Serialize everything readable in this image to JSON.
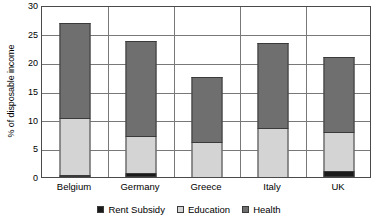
{
  "chart_data": {
    "type": "bar",
    "subtype": "stacked",
    "title": "",
    "xlabel": "",
    "ylabel": "% of disposable income",
    "categories": [
      "Belgium",
      "Germany",
      "Greece",
      "Italy",
      "UK"
    ],
    "series": [
      {
        "name": "Rent Subsidy",
        "color": "#1a1a1a",
        "values": [
          0.3,
          0.7,
          0.0,
          0.0,
          1.0
        ]
      },
      {
        "name": "Education",
        "color": "#d4d4d4",
        "values": [
          9.9,
          6.4,
          6.1,
          8.6,
          6.8
        ]
      },
      {
        "name": "Health",
        "color": "#6f6f6f",
        "values": [
          16.6,
          16.7,
          11.4,
          14.8,
          13.2
        ]
      }
    ],
    "totals": [
      26.8,
      23.8,
      17.5,
      23.4,
      21.0
    ],
    "cumulative_tops": [
      [
        0.3,
        10.2,
        26.8
      ],
      [
        0.7,
        7.1,
        23.8
      ],
      [
        0.0,
        6.1,
        17.5
      ],
      [
        0.0,
        8.6,
        23.4
      ],
      [
        1.0,
        7.8,
        21.0
      ]
    ],
    "ylim": [
      0,
      30
    ],
    "yticks": [
      0,
      5,
      10,
      15,
      20,
      25,
      30
    ],
    "ytick_labels": [
      "0",
      "5",
      "10",
      "15",
      "20",
      "25",
      "30"
    ],
    "grid": true,
    "grid_axis": "y",
    "legend_position": "bottom",
    "legend": [
      "Rent Subsidy",
      "Education",
      "Health"
    ]
  }
}
